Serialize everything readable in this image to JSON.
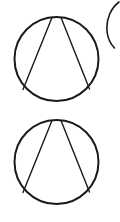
{
  "figure": {
    "title": "Two circles with inscribed chord pairs",
    "canvas": {
      "width": 120,
      "height": 222,
      "background_color": "#ffffff"
    },
    "stroke_color": "#1a1a1a",
    "shapes": [
      {
        "name": "top-circle-outline",
        "type": "circle",
        "cx": 56.5,
        "cy": 59.0,
        "r": 42.0,
        "stroke_width": 2.0
      },
      {
        "name": "top-circle-left-chord",
        "type": "line",
        "x1": 52.0,
        "y1": 17.5,
        "x2": 23.0,
        "y2": 89.5,
        "stroke_width": 1.4
      },
      {
        "name": "top-circle-right-chord",
        "type": "line",
        "x1": 61.0,
        "y1": 17.6,
        "x2": 89.5,
        "y2": 89.0,
        "stroke_width": 1.4
      },
      {
        "name": "bottom-circle-outline",
        "type": "circle",
        "cx": 56.5,
        "cy": 162.0,
        "r": 42.0,
        "stroke_width": 2.0
      },
      {
        "name": "bottom-circle-left-chord",
        "type": "line",
        "x1": 52.0,
        "y1": 120.5,
        "x2": 23.0,
        "y2": 192.5,
        "stroke_width": 1.4
      },
      {
        "name": "bottom-circle-right-chord",
        "type": "line",
        "x1": 61.0,
        "y1": 120.6,
        "x2": 89.5,
        "y2": 192.0,
        "stroke_width": 1.4
      },
      {
        "name": "partial-circle-arc-top-right",
        "type": "arc",
        "path": "M 119 2 C 111 8, 106 19, 107 31 C 107.6 38, 110.5 44, 114.5 48",
        "stroke_width": 1.6
      }
    ]
  }
}
